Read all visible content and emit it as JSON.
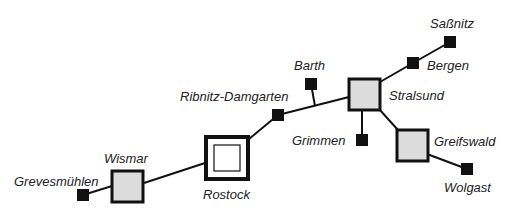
{
  "diagram": {
    "type": "network-map",
    "colors": {
      "line": "#111111",
      "node_fill_gray": "#dcdcdc",
      "node_fill_black": "#111111",
      "node_fill_white": "#ffffff"
    },
    "nodes": [
      {
        "id": "grevesmuehlen",
        "label": "Grevesmühlen",
        "kind": "small"
      },
      {
        "id": "wismar",
        "label": "Wismar",
        "kind": "medium"
      },
      {
        "id": "rostock",
        "label": "Rostock",
        "kind": "large"
      },
      {
        "id": "ribnitz",
        "label": "Ribnitz-Damgarten",
        "kind": "small"
      },
      {
        "id": "barth",
        "label": "Barth",
        "kind": "small"
      },
      {
        "id": "stralsund",
        "label": "Stralsund",
        "kind": "medium"
      },
      {
        "id": "grimmen",
        "label": "Grimmen",
        "kind": "small"
      },
      {
        "id": "bergen",
        "label": "Bergen",
        "kind": "small"
      },
      {
        "id": "sassnitz",
        "label": "Saßnitz",
        "kind": "small"
      },
      {
        "id": "greifswald",
        "label": "Greifswald",
        "kind": "medium"
      },
      {
        "id": "wolgast",
        "label": "Wolgast",
        "kind": "small"
      }
    ],
    "edges": [
      [
        "grevesmuehlen",
        "wismar"
      ],
      [
        "wismar",
        "rostock"
      ],
      [
        "rostock",
        "ribnitz"
      ],
      [
        "ribnitz",
        "stralsund"
      ],
      [
        "barth",
        "ribnitz-stralsund-line"
      ],
      [
        "stralsund",
        "grimmen"
      ],
      [
        "stralsund",
        "bergen"
      ],
      [
        "bergen",
        "sassnitz"
      ],
      [
        "stralsund",
        "greifswald"
      ],
      [
        "greifswald",
        "wolgast"
      ]
    ]
  }
}
